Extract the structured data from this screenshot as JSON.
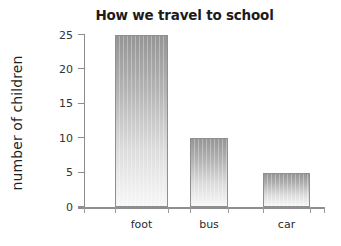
{
  "chart_data": {
    "type": "bar",
    "title": "How we travel to school",
    "xlabel": "",
    "ylabel": "number of children",
    "categories": [
      "foot",
      "bus",
      "car"
    ],
    "values": [
      25,
      10,
      5
    ],
    "ylim": [
      0,
      25
    ],
    "yticks": [
      0,
      5,
      10,
      15,
      20,
      25
    ],
    "ytick_labels": [
      "0",
      "5",
      "10",
      "15",
      "20",
      "25"
    ],
    "grid": false,
    "legend": false,
    "bar_fill": "#9a9a9a",
    "bar_border": "#8f8f8f",
    "axis_color": "#8c8c8c",
    "title_color": "#1c1c1c",
    "background": "#ffffff"
  }
}
